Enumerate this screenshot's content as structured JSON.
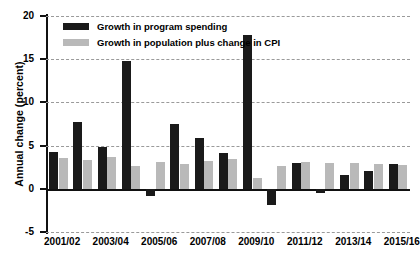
{
  "chart_data": {
    "type": "bar",
    "title": "",
    "subtitle": "",
    "xlabel": "",
    "ylabel": "Annual change (percent)",
    "ylim": [
      -5,
      20
    ],
    "yticks": [
      20,
      15,
      10,
      5,
      0,
      -5
    ],
    "ytick_labels": [
      "20",
      "15",
      "10",
      "5",
      "0",
      "-5"
    ],
    "grid": true,
    "grid_style": "dashed-horizontal",
    "legend_position": "top-left",
    "categories": [
      "2001/02",
      "2002/03",
      "2003/04",
      "2004/05",
      "2005/06",
      "2006/07",
      "2007/08",
      "2008/09",
      "2009/10",
      "2010/11",
      "2011/12",
      "2012/13",
      "2013/14",
      "2014/15",
      "2015/16"
    ],
    "tick_labels": [
      "2001/02",
      "2003/04",
      "2005/06",
      "2007/08",
      "2009/10",
      "2011/12",
      "2013/14",
      "2015/16"
    ],
    "tick_label_indices": [
      0,
      2,
      4,
      6,
      8,
      10,
      12,
      14
    ],
    "series": [
      {
        "name": "Growth in program spending",
        "color": "#1a1a1a",
        "values": [
          4.3,
          7.7,
          4.8,
          14.8,
          -0.8,
          7.5,
          5.9,
          4.1,
          17.8,
          -1.9,
          3.0,
          -0.5,
          1.6,
          2.1,
          2.9
        ]
      },
      {
        "name": "Growth in population plus change in CPI",
        "color": "#b9b9b9",
        "values": [
          3.6,
          3.3,
          3.7,
          2.6,
          3.1,
          2.9,
          3.2,
          3.4,
          1.2,
          2.6,
          3.1,
          3.0,
          3.0,
          2.9,
          2.8
        ]
      }
    ]
  },
  "legend": {
    "items": [
      {
        "label": "Growth in program spending",
        "color": "#1a1a1a"
      },
      {
        "label": "Growth in population plus change in CPI",
        "color": "#b9b9b9"
      }
    ]
  },
  "axes": {
    "y_title": "Annual change (percent)"
  },
  "colors": {
    "series_black": "#1a1a1a",
    "series_grey": "#b9b9b9",
    "gridline": "#9a9a9a",
    "axis": "#111111",
    "background": "#ffffff"
  }
}
